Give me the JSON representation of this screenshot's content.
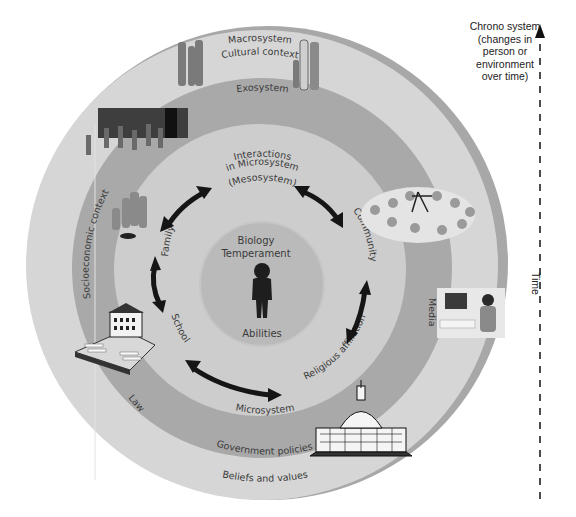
{
  "diagram": {
    "rings": {
      "macrosystem": {
        "label": "Macrosystem",
        "sublabel": "Cultural context",
        "color": "#d4d4d4"
      },
      "exosystem": {
        "label": "Exosystem",
        "color": "#a9a9a9"
      },
      "microsystem": {
        "label": "Microsystem",
        "color": "#cbcbcb"
      },
      "core": {
        "color": "#b9b9b9"
      },
      "outer_rim": {
        "color": "#a5a5a5"
      }
    },
    "mesosystem": {
      "line1": "Interactions",
      "line2": "in Microsystem",
      "line3": "(Mesosystem)"
    },
    "core_labels": {
      "top1": "Biology",
      "top2": "Temperament",
      "bottom": "Abilities"
    },
    "microsystem_items": {
      "family": "Family",
      "community": "Community",
      "school": "School",
      "religious": "Religious affiliation"
    },
    "exosystem_items": {
      "socioeconomic": "Socioeconomic context",
      "media": "Media",
      "law": "Law",
      "government": "Government policies"
    },
    "macrosystem_items": {
      "beliefs": "Beliefs and values"
    },
    "chronosystem": {
      "line1": "Chrono system",
      "line2": "(changes in",
      "line3": "person or",
      "line4": "environment",
      "line5": "over time)",
      "axis_label": "Time"
    },
    "icons": [
      "family-group-illustration",
      "workers-illustration",
      "playground-illustration",
      "media-tv-illustration",
      "school-building-illustration",
      "capitol-building-illustration",
      "child-silhouette-icon",
      "double-arrow-icon"
    ]
  }
}
